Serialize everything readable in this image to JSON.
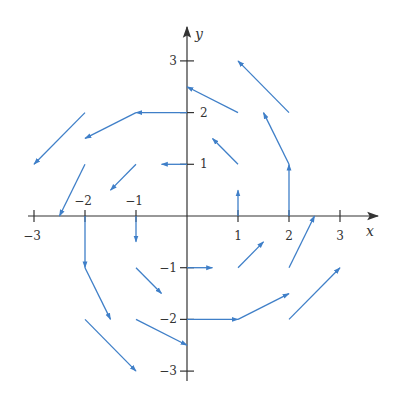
{
  "chart_data": {
    "type": "vector-field",
    "title": "",
    "xlabel": "x",
    "ylabel": "y",
    "xlim": [
      -3,
      3
    ],
    "ylim": [
      -3,
      3
    ],
    "grid": false,
    "x_ticks": [
      {
        "value": -3,
        "label": "−3"
      },
      {
        "value": -2,
        "label": "−2"
      },
      {
        "value": -1,
        "label": "−1"
      },
      {
        "value": 1,
        "label": "1"
      },
      {
        "value": 2,
        "label": "2"
      },
      {
        "value": 3,
        "label": "3"
      }
    ],
    "y_ticks": [
      {
        "value": 3,
        "label": "3"
      },
      {
        "value": 2,
        "label": "2"
      },
      {
        "value": 1,
        "label": "1"
      },
      {
        "value": -1,
        "label": "−1"
      },
      {
        "value": -2,
        "label": "−2"
      },
      {
        "value": -3,
        "label": "−3"
      }
    ],
    "field_description": "F(x, y) = -y i + x j, vectors drawn at half scale",
    "vector_scale": 0.5,
    "vectors": [
      {
        "x": 1,
        "y": 0,
        "u": 0,
        "v": 1
      },
      {
        "x": 2,
        "y": 0,
        "u": 0,
        "v": 2
      },
      {
        "x": 0,
        "y": 1,
        "u": -1,
        "v": 0
      },
      {
        "x": 1,
        "y": 1,
        "u": -1,
        "v": 1
      },
      {
        "x": 2,
        "y": 1,
        "u": -1,
        "v": 2
      },
      {
        "x": 0,
        "y": 2,
        "u": -2,
        "v": 0
      },
      {
        "x": 1,
        "y": 2,
        "u": -2,
        "v": 1
      },
      {
        "x": 2,
        "y": 2,
        "u": -2,
        "v": 2
      },
      {
        "x": -1,
        "y": 1,
        "u": -1,
        "v": -1
      },
      {
        "x": -1,
        "y": 2,
        "u": -2,
        "v": -1
      },
      {
        "x": -2,
        "y": 1,
        "u": -1,
        "v": -2
      },
      {
        "x": -2,
        "y": 2,
        "u": -2,
        "v": -2
      },
      {
        "x": -1,
        "y": 0,
        "u": 0,
        "v": -1
      },
      {
        "x": -2,
        "y": 0,
        "u": 0,
        "v": -2
      },
      {
        "x": -1,
        "y": -1,
        "u": 1,
        "v": -1
      },
      {
        "x": -2,
        "y": -1,
        "u": 1,
        "v": -2
      },
      {
        "x": -1,
        "y": -2,
        "u": 2,
        "v": -1
      },
      {
        "x": -2,
        "y": -2,
        "u": 2,
        "v": -2
      },
      {
        "x": 0,
        "y": -1,
        "u": 1,
        "v": 0
      },
      {
        "x": 0,
        "y": -2,
        "u": 2,
        "v": 0
      },
      {
        "x": 1,
        "y": -1,
        "u": 1,
        "v": 1
      },
      {
        "x": 1,
        "y": -2,
        "u": 2,
        "v": 1
      },
      {
        "x": 2,
        "y": -1,
        "u": 1,
        "v": 2
      },
      {
        "x": 2,
        "y": -2,
        "u": 2,
        "v": 2
      }
    ],
    "colors": {
      "vector": "#3f7fc8",
      "axis": "#333333"
    }
  }
}
